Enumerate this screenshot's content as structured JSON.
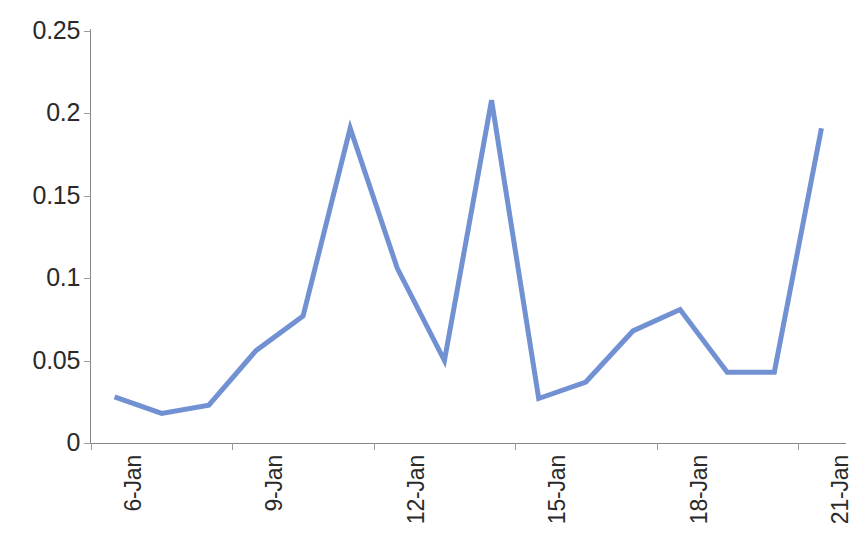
{
  "chart_data": {
    "type": "line",
    "title": "",
    "subtitle": "",
    "xlabel": "",
    "ylabel": "",
    "categories": [
      "6-Jan",
      "7-Jan",
      "8-Jan",
      "9-Jan",
      "10-Jan",
      "11-Jan",
      "12-Jan",
      "13-Jan",
      "14-Jan",
      "15-Jan",
      "16-Jan",
      "17-Jan",
      "18-Jan",
      "19-Jan",
      "20-Jan",
      "21-Jan"
    ],
    "values": [
      0.028,
      0.018,
      0.023,
      0.056,
      0.077,
      0.191,
      0.106,
      0.05,
      0.208,
      0.027,
      0.037,
      0.068,
      0.081,
      0.043,
      0.043,
      0.191
    ],
    "series": [
      {
        "name": "Series 1",
        "color": "#7191D3",
        "values": [
          0.028,
          0.018,
          0.023,
          0.056,
          0.077,
          0.191,
          0.106,
          0.05,
          0.208,
          0.027,
          0.037,
          0.068,
          0.081,
          0.043,
          0.043,
          0.191
        ]
      }
    ],
    "ylim": [
      0,
      0.25
    ],
    "yticks": [
      0,
      0.05,
      0.1,
      0.15,
      0.2,
      0.25
    ],
    "ytick_labels": [
      "0",
      "0.05",
      "0.1",
      "0.15",
      "0.2",
      "0.25"
    ],
    "xtick_labels": [
      "6-Jan",
      "9-Jan",
      "12-Jan",
      "15-Jan",
      "18-Jan",
      "21-Jan"
    ],
    "xtick_indices": [
      0,
      3,
      6,
      9,
      12,
      15
    ],
    "xtick_label_rotation": -90,
    "grid": false,
    "legend": false,
    "legend_position": "none",
    "markers": false,
    "line_width": 5,
    "axis_color": "#868686",
    "text_color": "#2a2a2a",
    "background": "#ffffff"
  }
}
